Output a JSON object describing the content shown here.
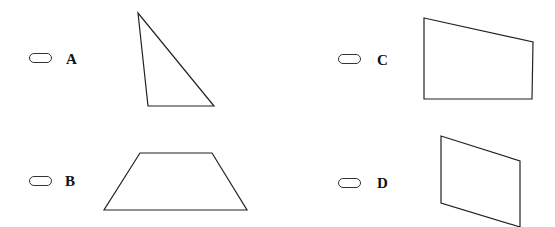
{
  "options": [
    {
      "id": "A",
      "label": "A",
      "shape": "triangle",
      "points": "138,13 148,106 214,106"
    },
    {
      "id": "B",
      "label": "B",
      "shape": "trapezoid",
      "points": "140,153 212,153 247,210 104,210"
    },
    {
      "id": "C",
      "label": "C",
      "shape": "quadrilateral",
      "points": "424,18 533,42 532,99 424,99"
    },
    {
      "id": "D",
      "label": "D",
      "shape": "parallelogram",
      "points": "441,136 520,161 520,227 441,203"
    }
  ],
  "colors": {
    "stroke": "#222222",
    "background": "#ffffff"
  }
}
